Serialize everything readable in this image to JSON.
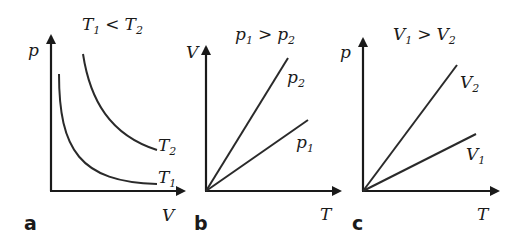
{
  "panels": [
    {
      "letter": "a",
      "title": {
        "left": "T",
        "left_sub": "1",
        "op": "<",
        "right": "T",
        "right_sub": "2"
      },
      "x_axis": "V",
      "y_axis": "p",
      "curves": [
        {
          "label": "T",
          "sub": "2",
          "type": "hyperbola"
        },
        {
          "label": "T",
          "sub": "1",
          "type": "hyperbola"
        }
      ]
    },
    {
      "letter": "b",
      "title": {
        "left": "p",
        "left_sub": "1",
        "op": ">",
        "right": "p",
        "right_sub": "2"
      },
      "x_axis": "T",
      "y_axis": "V",
      "curves": [
        {
          "label": "p",
          "sub": "2",
          "type": "line"
        },
        {
          "label": "p",
          "sub": "1",
          "type": "line"
        }
      ]
    },
    {
      "letter": "c",
      "title": {
        "left": "V",
        "left_sub": "1",
        "op": ">",
        "right": "V",
        "right_sub": "2"
      },
      "x_axis": "T",
      "y_axis": "p",
      "curves": [
        {
          "label": "V",
          "sub": "2",
          "type": "line"
        },
        {
          "label": "V",
          "sub": "1",
          "type": "line"
        }
      ]
    }
  ],
  "colors": {
    "ink": "#1a1a1a",
    "background": "#ffffff"
  }
}
